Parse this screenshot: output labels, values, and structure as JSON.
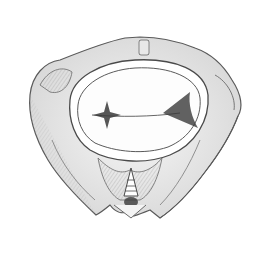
{
  "image": {
    "subject": "pencil sketch of a pelvis viewed from above",
    "background": "#ffffff",
    "stroke_color": "#555555",
    "shade_color": "#c8c8c8",
    "dark_shade_color": "#3a3a3a"
  }
}
